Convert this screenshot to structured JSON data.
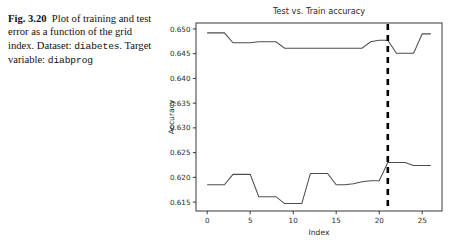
{
  "caption": {
    "figure_label": "Fig. 3.20",
    "text_part_1": "Plot of training and test error as a function of the grid index. Dataset: ",
    "dataset_name": "diabetes",
    "text_part_2": ". Target variable:",
    "target_variable": "diabprog"
  },
  "chart_data": {
    "type": "line",
    "title": "Test vs. Train accuracy",
    "xlabel": "Index",
    "ylabel": "Accuracy",
    "xlim": [
      -1.3,
      27.3
    ],
    "ylim": [
      0.6132,
      0.6512
    ],
    "xticks": [
      0,
      5,
      10,
      15,
      20,
      25
    ],
    "xticklabels": [
      "0",
      "5",
      "10",
      "15",
      "20",
      "25"
    ],
    "yticks": [
      0.615,
      0.62,
      0.625,
      0.63,
      0.635,
      0.64,
      0.645,
      0.65
    ],
    "yticklabels": [
      "0.615",
      "0.620",
      "0.625",
      "0.630",
      "0.635",
      "0.640",
      "0.645",
      "0.650"
    ],
    "grid": false,
    "legend": null,
    "line_color": "#4d4d4d",
    "annotation_color": "#000000",
    "x": [
      0,
      1,
      2,
      3,
      4,
      5,
      6,
      7,
      8,
      9,
      10,
      11,
      12,
      13,
      14,
      15,
      16,
      17,
      18,
      19,
      20,
      21,
      22,
      23,
      24,
      25,
      26
    ],
    "series": [
      {
        "name": "Train accuracy",
        "values": [
          0.6492,
          0.6492,
          0.6492,
          0.6472,
          0.6472,
          0.6472,
          0.6474,
          0.6474,
          0.6474,
          0.6461,
          0.6461,
          0.6461,
          0.6461,
          0.6461,
          0.6461,
          0.6461,
          0.6461,
          0.6461,
          0.6461,
          0.6474,
          0.6477,
          0.6477,
          0.6451,
          0.6451,
          0.6451,
          0.649,
          0.649
        ]
      },
      {
        "name": "Test accuracy",
        "values": [
          0.6185,
          0.6185,
          0.6185,
          0.6206,
          0.6206,
          0.6206,
          0.6161,
          0.6161,
          0.6161,
          0.6147,
          0.6147,
          0.6147,
          0.6208,
          0.6208,
          0.6208,
          0.6185,
          0.6185,
          0.6187,
          0.6191,
          0.6193,
          0.6193,
          0.623,
          0.623,
          0.623,
          0.6224,
          0.6224,
          0.6224
        ]
      }
    ],
    "annotations": [
      {
        "kind": "vertical-dashed-line",
        "x": 21,
        "label": "selected index"
      }
    ]
  }
}
